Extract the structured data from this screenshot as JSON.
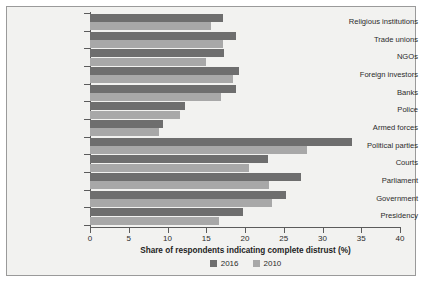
{
  "chart_data": {
    "type": "bar",
    "orientation": "horizontal",
    "title": "",
    "xlabel": "Share of respondents indicating complete distrust (%)",
    "ylabel": "",
    "xlim": [
      0,
      40
    ],
    "xticks": [
      "0",
      "5",
      "10",
      "15",
      "20",
      "25",
      "30",
      "35",
      "40"
    ],
    "grid": false,
    "legend_position": "bottom",
    "categories": [
      "Religious institutions",
      "Trade unions",
      "NGOs",
      "Foreign investors",
      "Banks",
      "Police",
      "Armed forces",
      "Political parties",
      "Courts",
      "Parliament",
      "Government",
      "Presidency"
    ],
    "series": [
      {
        "name": "2016",
        "color": "#6e6e6e",
        "values": [
          17.2,
          18.9,
          17.3,
          19.2,
          18.9,
          12.2,
          9.4,
          33.8,
          23.0,
          27.2,
          25.3,
          19.8
        ]
      },
      {
        "name": "2010",
        "color": "#a8a8a8",
        "values": [
          15.6,
          17.1,
          15.0,
          18.5,
          16.9,
          11.6,
          8.9,
          28.0,
          20.5,
          23.1,
          23.5,
          16.7
        ]
      }
    ]
  },
  "legend": {
    "items": [
      {
        "label": "2016",
        "color": "#6e6e6e"
      },
      {
        "label": "2010",
        "color": "#a8a8a8"
      }
    ]
  }
}
